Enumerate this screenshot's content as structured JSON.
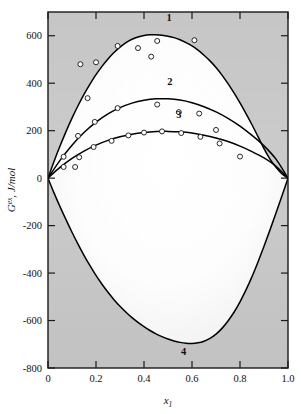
{
  "chart_data": {
    "type": "line",
    "title": "",
    "subtitle": "",
    "xlabel": "x1",
    "xlabel_base": "x",
    "xlabel_sub": "1",
    "ylabel": "G^ex, J/mol",
    "ylabel_base": "G",
    "ylabel_sup": "ex",
    "ylabel_rest": ", J/mol",
    "xlim": [
      0,
      1.0
    ],
    "ylim": [
      -800,
      700
    ],
    "grid": false,
    "legend_position": "inline-curve-labels",
    "xticks": [
      0,
      0.2,
      0.4,
      0.6,
      0.8,
      1.0
    ],
    "xtick_labels": [
      "0",
      "0.2",
      "0.4",
      "0.6",
      "0.8",
      "1.0"
    ],
    "yticks": [
      600,
      400,
      200,
      0,
      -200,
      -400,
      -600,
      -800
    ],
    "ytick_labels": [
      "600",
      "400",
      "200",
      "0",
      "-200",
      "-400",
      "-600",
      "-800"
    ],
    "series": [
      {
        "name": "1",
        "label": "1",
        "label_x": 0.505,
        "label_y": 660,
        "curve": [
          [
            0.0,
            0
          ],
          [
            0.025,
            70
          ],
          [
            0.05,
            135
          ],
          [
            0.075,
            196
          ],
          [
            0.1,
            253
          ],
          [
            0.125,
            305
          ],
          [
            0.15,
            353
          ],
          [
            0.175,
            396
          ],
          [
            0.2,
            436
          ],
          [
            0.225,
            471
          ],
          [
            0.25,
            502
          ],
          [
            0.275,
            529
          ],
          [
            0.3,
            552
          ],
          [
            0.325,
            571
          ],
          [
            0.35,
            585
          ],
          [
            0.375,
            595
          ],
          [
            0.4,
            601
          ],
          [
            0.425,
            604
          ],
          [
            0.45,
            604
          ],
          [
            0.475,
            602
          ],
          [
            0.5,
            598
          ],
          [
            0.525,
            592
          ],
          [
            0.55,
            583
          ],
          [
            0.575,
            571
          ],
          [
            0.6,
            557
          ],
          [
            0.625,
            539
          ],
          [
            0.65,
            518
          ],
          [
            0.675,
            494
          ],
          [
            0.7,
            466
          ],
          [
            0.725,
            434
          ],
          [
            0.75,
            398
          ],
          [
            0.775,
            359
          ],
          [
            0.8,
            317
          ],
          [
            0.825,
            272
          ],
          [
            0.85,
            225
          ],
          [
            0.875,
            175
          ],
          [
            0.9,
            124
          ],
          [
            0.925,
            80
          ],
          [
            0.95,
            46
          ],
          [
            0.975,
            18
          ],
          [
            1.0,
            0
          ]
        ],
        "points": [
          [
            0.065,
            90
          ],
          [
            0.113,
            47
          ],
          [
            0.135,
            480
          ],
          [
            0.165,
            337
          ],
          [
            0.2,
            488
          ],
          [
            0.29,
            557
          ],
          [
            0.375,
            548
          ],
          [
            0.43,
            512
          ],
          [
            0.455,
            578
          ],
          [
            0.61,
            581
          ]
        ]
      },
      {
        "name": "2",
        "label": "2",
        "label_x": 0.508,
        "label_y": 392,
        "curve": [
          [
            0.0,
            0
          ],
          [
            0.05,
            75
          ],
          [
            0.1,
            139
          ],
          [
            0.15,
            192
          ],
          [
            0.2,
            236
          ],
          [
            0.25,
            271
          ],
          [
            0.3,
            297
          ],
          [
            0.35,
            316
          ],
          [
            0.4,
            328
          ],
          [
            0.45,
            334
          ],
          [
            0.5,
            334
          ],
          [
            0.55,
            329
          ],
          [
            0.6,
            318
          ],
          [
            0.65,
            301
          ],
          [
            0.7,
            279
          ],
          [
            0.75,
            252
          ],
          [
            0.8,
            219
          ],
          [
            0.85,
            180
          ],
          [
            0.9,
            136
          ],
          [
            0.95,
            80
          ],
          [
            1.0,
            0
          ]
        ],
        "points": [
          [
            0.125,
            178
          ],
          [
            0.195,
            237
          ],
          [
            0.29,
            295
          ],
          [
            0.455,
            310
          ],
          [
            0.545,
            278
          ],
          [
            0.63,
            272
          ],
          [
            0.7,
            203
          ]
        ]
      },
      {
        "name": "3",
        "label": "3",
        "label_x": 0.545,
        "label_y": 253,
        "curve": [
          [
            0.0,
            0
          ],
          [
            0.05,
            45
          ],
          [
            0.1,
            83
          ],
          [
            0.15,
            114
          ],
          [
            0.2,
            139
          ],
          [
            0.25,
            159
          ],
          [
            0.3,
            174
          ],
          [
            0.35,
            185
          ],
          [
            0.4,
            192
          ],
          [
            0.45,
            196
          ],
          [
            0.5,
            197
          ],
          [
            0.55,
            195
          ],
          [
            0.6,
            190
          ],
          [
            0.65,
            181
          ],
          [
            0.7,
            169
          ],
          [
            0.75,
            154
          ],
          [
            0.8,
            135
          ],
          [
            0.85,
            112
          ],
          [
            0.9,
            85
          ],
          [
            0.95,
            50
          ],
          [
            1.0,
            0
          ]
        ],
        "points": [
          [
            0.065,
            47
          ],
          [
            0.13,
            88
          ],
          [
            0.19,
            131
          ],
          [
            0.265,
            157
          ],
          [
            0.335,
            180
          ],
          [
            0.4,
            192
          ],
          [
            0.475,
            197
          ],
          [
            0.555,
            190
          ],
          [
            0.635,
            174
          ],
          [
            0.715,
            146
          ],
          [
            0.8,
            91
          ]
        ]
      },
      {
        "name": "4",
        "label": "4",
        "label_x": 0.565,
        "label_y": -745,
        "curve": [
          [
            0.0,
            0
          ],
          [
            0.025,
            -62
          ],
          [
            0.05,
            -120
          ],
          [
            0.075,
            -175
          ],
          [
            0.1,
            -228
          ],
          [
            0.125,
            -278
          ],
          [
            0.15,
            -325
          ],
          [
            0.175,
            -369
          ],
          [
            0.2,
            -410
          ],
          [
            0.225,
            -447
          ],
          [
            0.25,
            -481
          ],
          [
            0.275,
            -512
          ],
          [
            0.3,
            -540
          ],
          [
            0.325,
            -565
          ],
          [
            0.35,
            -588
          ],
          [
            0.375,
            -608
          ],
          [
            0.4,
            -626
          ],
          [
            0.425,
            -642
          ],
          [
            0.45,
            -656
          ],
          [
            0.475,
            -668
          ],
          [
            0.5,
            -678
          ],
          [
            0.525,
            -686
          ],
          [
            0.55,
            -692
          ],
          [
            0.575,
            -696
          ],
          [
            0.6,
            -697
          ],
          [
            0.625,
            -694
          ],
          [
            0.65,
            -687
          ],
          [
            0.675,
            -675
          ],
          [
            0.7,
            -657
          ],
          [
            0.725,
            -633
          ],
          [
            0.75,
            -602
          ],
          [
            0.775,
            -565
          ],
          [
            0.8,
            -521
          ],
          [
            0.825,
            -471
          ],
          [
            0.85,
            -415
          ],
          [
            0.875,
            -353
          ],
          [
            0.9,
            -287
          ],
          [
            0.925,
            -218
          ],
          [
            0.95,
            -147
          ],
          [
            0.975,
            -74
          ],
          [
            1.0,
            0
          ]
        ],
        "points": []
      }
    ],
    "colors": {
      "curve": "#000000",
      "frame": "#1a1a1a",
      "plot_background_outer": "#c9c9c9",
      "plot_background_inner": "#fbfbfb",
      "marker_fill": "#ffffff",
      "page_background": "#ffffff"
    }
  }
}
